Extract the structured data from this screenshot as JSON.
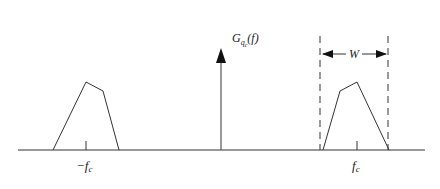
{
  "diagram": {
    "type": "spectrum",
    "title_label": {
      "main": "G",
      "sub": "q",
      "subsub": "c",
      "arg": "(f)"
    },
    "axis": {
      "x_start": 18,
      "x_end": 425,
      "y": 150
    },
    "impulse": {
      "x": 221,
      "top": 50
    },
    "left_band": {
      "label_minus": "−",
      "label": "f",
      "label_sub": "c"
    },
    "right_band": {
      "label": "f",
      "label_sub": "c"
    },
    "bandwidth_label": "W",
    "colors": {
      "stroke": "#333333",
      "arrow": "#111111"
    }
  }
}
